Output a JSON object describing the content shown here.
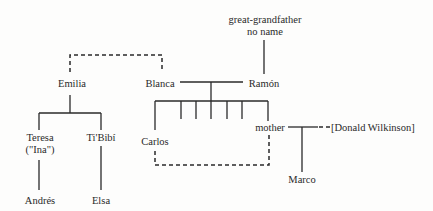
{
  "diagram": {
    "type": "family-tree",
    "nodes": {
      "great_grandfather_line1": "great-grandfather",
      "great_grandfather_line2": "no name",
      "emilia": "Emilia",
      "blanca": "Blanca",
      "ramon": "Ramón",
      "teresa_line1": "Teresa",
      "teresa_line2": "(\"Ina\")",
      "tibibi": "Ti'Bibí",
      "carlos": "Carlos",
      "mother": "mother",
      "donald": "[Donald Wilkinson]",
      "marco": "Marco",
      "andres": "Andrés",
      "elsa": "Elsa"
    },
    "relations": [
      {
        "from": "great-grandfather no name",
        "to": "Ramón",
        "style": "solid"
      },
      {
        "from": "Emilia",
        "to": "Blanca",
        "style": "dashed"
      },
      {
        "from": "Blanca",
        "to": "Ramón",
        "style": "solid",
        "kind": "couple"
      },
      {
        "from": "Blanca+Ramón",
        "to": "children (7)",
        "style": "solid"
      },
      {
        "from": "Emilia",
        "to": "Teresa",
        "style": "solid"
      },
      {
        "from": "Emilia",
        "to": "Ti'Bibí",
        "style": "solid"
      },
      {
        "from": "Teresa",
        "to": "Andrés",
        "style": "solid"
      },
      {
        "from": "Ti'Bibí",
        "to": "Elsa",
        "style": "solid"
      },
      {
        "from": "Carlos",
        "to": "mother",
        "style": "dashed"
      },
      {
        "from": "mother",
        "to": "[Donald Wilkinson]",
        "style": "dashed",
        "kind": "couple"
      },
      {
        "from": "mother+Donald",
        "to": "Marco",
        "style": "solid"
      }
    ],
    "colors": {
      "line": "#2a2a2a",
      "background": "#fdfdfc"
    }
  }
}
